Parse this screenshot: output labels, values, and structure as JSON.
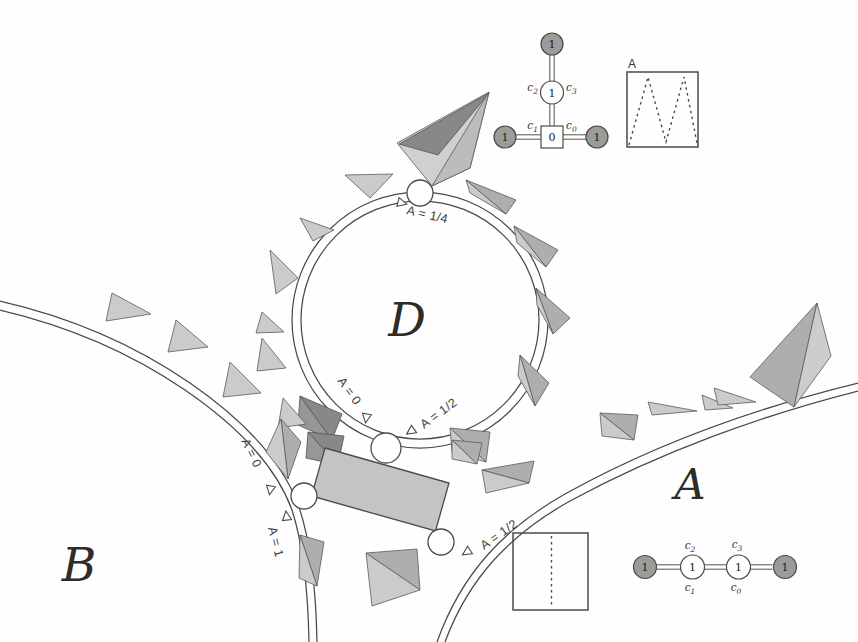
{
  "regions": {
    "circle": "D",
    "right": "A",
    "left": "B"
  },
  "circle_d_arc_labels": {
    "top": "A = 1/4",
    "bottom_left": "A = 0",
    "bottom_right": "A = 1/2"
  },
  "arc_b_labels": {
    "upper": "A = 0",
    "lower": "A = 1"
  },
  "arc_a_labels": {
    "label": "A = 1/2"
  },
  "tree_inset": {
    "top_value": "1",
    "mid_value": "1",
    "square_value": "0",
    "left_value": "1",
    "right_value": "1",
    "c2": {
      "base": "c",
      "sub": "2"
    },
    "c3": {
      "base": "c",
      "sub": "3"
    },
    "c1": {
      "base": "c",
      "sub": "1"
    },
    "c0": {
      "base": "c",
      "sub": "0"
    }
  },
  "wave_inset": {
    "label": "A"
  },
  "path_inset": {
    "values": [
      "1",
      "1",
      "1",
      "1"
    ],
    "c2": {
      "base": "c",
      "sub": "2"
    },
    "c3": {
      "base": "c",
      "sub": "3"
    },
    "c1": {
      "base": "c",
      "sub": "1"
    },
    "c0": {
      "base": "c",
      "sub": "0"
    }
  },
  "colors": {
    "line": "#4c4a46",
    "tooth_light": "#cbcbcb",
    "tooth_mid": "#aeaeae",
    "tooth_dark": "#979797",
    "node_gray": "#9b9b9b"
  }
}
